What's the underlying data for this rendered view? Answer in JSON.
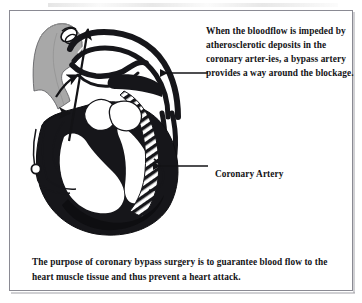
{
  "figure": {
    "callout_top": "When the bloodflow is impeded by atherosclerotic deposits in the coronary arter-ies, a bypass artery provides a way around the blockage.",
    "label_coronary_artery": "Coronary Artery",
    "caption_bottom": "The purpose of coronary bypass surgery is to guarantee blood flow to the heart muscle tissue and thus prevent a heart attack.",
    "colors": {
      "ink": "#131316",
      "graft_gray": "#a8a8a8",
      "graft_gray_shade": "#8f8f8f",
      "myocardium": "#16161a",
      "frame": "#8a8a93",
      "page": "#ffffff"
    },
    "illustration": {
      "title": "coronary-bypass-heart-diagram",
      "parts": [
        "bypass-graft-vessel",
        "aortic-arch",
        "pulmonary-artery",
        "heart-myocardium",
        "interventricular-septum-hatched",
        "coronary-artery",
        "bloodflow-arrow-main",
        "bloodflow-arrow-secondary",
        "vessel-cross-section"
      ]
    }
  }
}
